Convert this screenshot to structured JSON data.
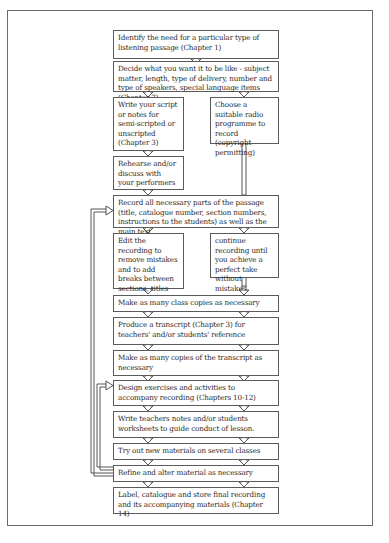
{
  "steps": {
    "identify": "Identify the need for a particular type of listening passage (Chapter 1)",
    "decide": "Decide what you want it to be like - subject matter, length, type of delivery, number and type of speakers, special language items (Chapter 7)",
    "write_script": "Write your script or notes for semi-scripted or unscripted (Chapter 3)",
    "choose_radio": "Choose a suitable radio programme to record (copyright permitting)",
    "rehearse": "Rehearse and/or discuss with your performers",
    "record": "Record all necessary parts of the passage (title, catalogue number, section numbers, instructions to the students) as well as the main text.",
    "edit": "Edit the recording to remove mistakes and to add breaks between sections, titles etc.",
    "continue": "continue recording until you achieve a perfect take without mistakes.",
    "class_copies": "Make as many class copies as necessary",
    "transcript": "Produce a transcript (Chapter 3) for teachers' and/or students' reference",
    "transcript_copies": "Make as many copies of the transcript as necessary",
    "design": "Design exercises and activities to accompany recording (Chapters 10-12)",
    "notes": "Write teachers notes and/or students worksheets to guide conduct of lesson.",
    "try_out": "Try out new materials on several classes",
    "refine": "Refine and alter material as necessary",
    "label": "Label, catalogue and store final recording and its accompanying materials (Chapter 14)"
  },
  "feedback_loops": [
    {
      "from": "refine",
      "to": "design"
    },
    {
      "from": "refine",
      "to": "record"
    }
  ]
}
